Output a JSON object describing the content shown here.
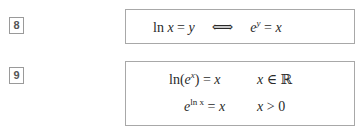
{
  "items": [
    {
      "number": "8",
      "formula": {
        "lhs_fn": "ln",
        "lhs_var": "x",
        "eq1": "=",
        "lhs_rhs": "y",
        "iff": "⟺",
        "base": "e",
        "exp": "y",
        "eq2": "=",
        "rhs": "x"
      }
    },
    {
      "number": "9",
      "rows": [
        {
          "fn": "ln(",
          "base": "e",
          "exp": "x",
          "close": ")",
          "eq": "=",
          "rhs": "x",
          "cond_var": "x",
          "cond_op": "∈",
          "cond_val": "ℝ"
        },
        {
          "base": "e",
          "exp": "ln x",
          "eq": "=",
          "rhs": "x",
          "cond_var": "x",
          "cond_op": ">",
          "cond_val": "0"
        }
      ]
    }
  ]
}
